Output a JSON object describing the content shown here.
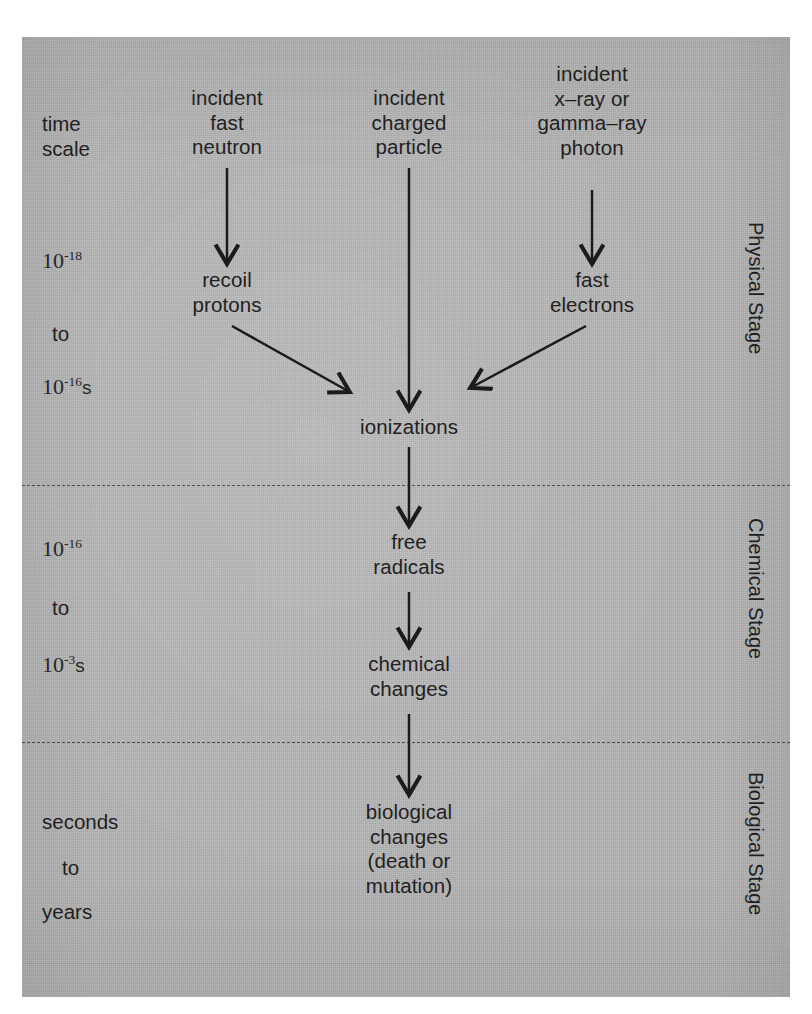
{
  "figure": {
    "panel_color": "#b4b4b4",
    "ink_color": "#212121"
  },
  "axis": {
    "time_scale_label": "time\nscale"
  },
  "time_scale": {
    "physical": {
      "from_mantissa": "10",
      "from_exponent": "-18",
      "from_unit": "",
      "connector": "to",
      "to_mantissa": "10",
      "to_exponent": "-16",
      "to_unit": "s"
    },
    "chemical": {
      "from_mantissa": "10",
      "from_exponent": "-16",
      "from_unit": "",
      "connector": "to",
      "to_mantissa": "10",
      "to_exponent": "-3",
      "to_unit": "s"
    },
    "biological": {
      "from_text": "seconds",
      "connector": "to",
      "to_text": "years"
    }
  },
  "stages": [
    {
      "key": "physical",
      "label": "Physical Stage"
    },
    {
      "key": "chemical",
      "label": "Chemical Stage"
    },
    {
      "key": "biological",
      "label": "Biological Stage"
    }
  ],
  "nodes": {
    "incident_fast_neutron": "incident\nfast\nneutron",
    "incident_charged_particle": "incident\ncharged\nparticle",
    "incident_photon": "incident\nx–ray or\ngamma–ray\nphoton",
    "recoil_protons": "recoil\nprotons",
    "fast_electrons": "fast\nelectrons",
    "ionizations": "ionizations",
    "free_radicals": "free\nradicals",
    "chemical_changes": "chemical\nchanges",
    "biological_changes": "biological\nchanges\n(death or\nmutation)"
  },
  "flow_edges": [
    {
      "from": "incident_fast_neutron",
      "to": "recoil_protons",
      "kind": "vertical"
    },
    {
      "from": "incident_charged_particle",
      "to": "ionizations",
      "kind": "vertical-long"
    },
    {
      "from": "incident_photon",
      "to": "fast_electrons",
      "kind": "vertical"
    },
    {
      "from": "recoil_protons",
      "to": "ionizations",
      "kind": "diagonal-right-down"
    },
    {
      "from": "fast_electrons",
      "to": "ionizations",
      "kind": "diagonal-left-down"
    },
    {
      "from": "ionizations",
      "to": "free_radicals",
      "kind": "vertical"
    },
    {
      "from": "free_radicals",
      "to": "chemical_changes",
      "kind": "vertical"
    },
    {
      "from": "chemical_changes",
      "to": "biological_changes",
      "kind": "vertical"
    }
  ]
}
